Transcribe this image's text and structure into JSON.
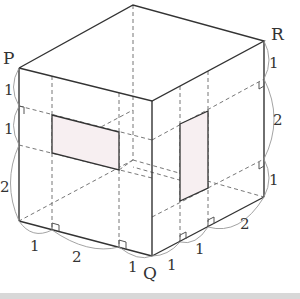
{
  "diagram": {
    "type": "cube-with-cross-sections",
    "vertex_labels": {
      "P": "P",
      "Q": "Q",
      "R": "R"
    },
    "front_face": {
      "vertical_segments": [
        "1",
        "1",
        "2"
      ],
      "horizontal_segments": [
        "1",
        "2",
        "1"
      ]
    },
    "right_face": {
      "vertical_segments": [
        "1",
        "2",
        "1"
      ],
      "horizontal_segments": [
        "1",
        "1",
        "2"
      ]
    },
    "colors": {
      "edge": "#333333",
      "dashed": "#777777",
      "fill": "#f7eff1",
      "arc": "#999999"
    }
  }
}
